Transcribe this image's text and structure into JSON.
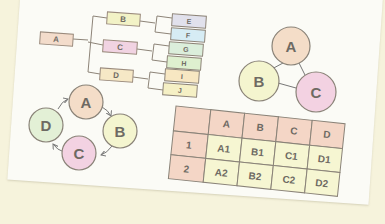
{
  "scene": {
    "description": "Photo of a printed sheet with four diagram types",
    "background_color": "#f6f3dc",
    "paper_color": "#fbfbf6"
  },
  "tree": {
    "root": {
      "label": "A",
      "color": "#f3dccb"
    },
    "level1": [
      {
        "label": "B",
        "color": "#f2f2c6"
      },
      {
        "label": "C",
        "color": "#f1d3e2"
      },
      {
        "label": "D",
        "color": "#f6e8c6"
      }
    ],
    "level2": [
      {
        "label": "E",
        "color": "#e1e1ec",
        "parent": "B"
      },
      {
        "label": "F",
        "color": "#d6ecf4",
        "parent": "B"
      },
      {
        "label": "G",
        "color": "#dbeedb",
        "parent": "C"
      },
      {
        "label": "H",
        "color": "#def0cf",
        "parent": "C"
      },
      {
        "label": "I",
        "color": "#f7e7c2",
        "parent": "D"
      },
      {
        "label": "J",
        "color": "#f5f0c5",
        "parent": "D"
      }
    ]
  },
  "triangle_graph": {
    "nodes": [
      {
        "label": "A",
        "color": "#f4ddc8"
      },
      {
        "label": "B",
        "color": "#f4f5cf"
      },
      {
        "label": "C",
        "color": "#f3d2e2"
      }
    ],
    "edges": [
      [
        "A",
        "B"
      ],
      [
        "A",
        "C"
      ],
      [
        "B",
        "C"
      ]
    ]
  },
  "cycle": {
    "nodes": [
      {
        "label": "A",
        "color": "#f4ddc8"
      },
      {
        "label": "B",
        "color": "#f4f5cf"
      },
      {
        "label": "C",
        "color": "#f3d2e2"
      },
      {
        "label": "D",
        "color": "#e3f0d6"
      }
    ],
    "direction": "clockwise A→B→C→D→A"
  },
  "table": {
    "header_color": "#f4d6c6",
    "cell_color": "#f6f6d2",
    "columns": [
      "",
      "A",
      "B",
      "C",
      "D"
    ],
    "rows": [
      [
        "1",
        "A1",
        "B1",
        "C1",
        "D1"
      ],
      [
        "2",
        "A2",
        "B2",
        "C2",
        "D2"
      ]
    ]
  }
}
